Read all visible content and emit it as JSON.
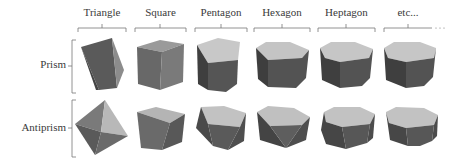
{
  "figure": {
    "columns": [
      {
        "label": "Triangle",
        "x0": 78,
        "x1": 126
      },
      {
        "label": "Square",
        "x0": 135,
        "x1": 186
      },
      {
        "label": "Pentagon",
        "x0": 195,
        "x1": 247
      },
      {
        "label": "Hexagon",
        "x0": 254,
        "x1": 310
      },
      {
        "label": "Heptagon",
        "x0": 318,
        "x1": 375
      },
      {
        "label": "etc...",
        "x0": 384,
        "x1": 432
      }
    ],
    "rows": [
      {
        "label": "Prism"
      },
      {
        "label": "Antiprism"
      }
    ],
    "colors": {
      "bracket": "#777777",
      "face_light": "#c8c8c8",
      "face_mid": "#8a8a8a",
      "face_dark": "#555555",
      "face_darker": "#444444"
    }
  }
}
